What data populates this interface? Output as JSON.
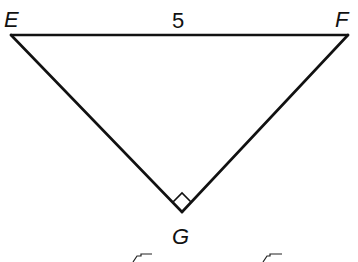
{
  "diagram": {
    "type": "right-triangle",
    "vertices": [
      {
        "id": "E",
        "label": "E"
      },
      {
        "id": "F",
        "label": "F"
      },
      {
        "id": "G",
        "label": "G"
      }
    ],
    "sides": [
      {
        "from": "E",
        "to": "F",
        "length_label": "5"
      },
      {
        "from": "E",
        "to": "G",
        "length_label": ""
      },
      {
        "from": "F",
        "to": "G",
        "length_label": ""
      }
    ],
    "right_angle_at": "G",
    "colors": {
      "stroke": "#111111",
      "background": "#ffffff"
    }
  }
}
